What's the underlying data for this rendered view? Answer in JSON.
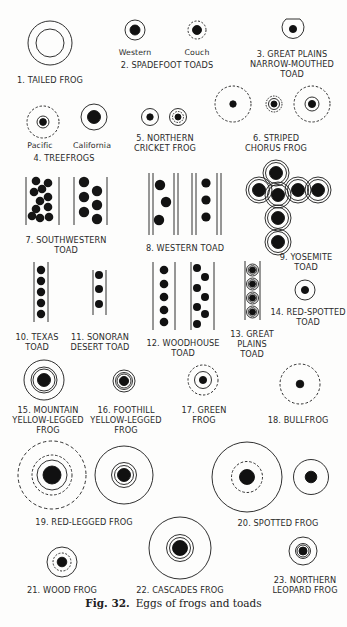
{
  "figure": {
    "caption_number": "Fig. 32.",
    "caption_text": "Eggs of frogs and toads",
    "colors": {
      "ink": "#111111",
      "paper": "#fdfdfc",
      "text": "#2a2a2a"
    }
  },
  "species": [
    {
      "id": 1,
      "label": "1. TAILED FROG",
      "egg": "two concentric solid rings, no visible yolk"
    },
    {
      "id": 2,
      "label": "2. SPADEFOOT TOADS",
      "sublabels": [
        "Western",
        "Couch"
      ],
      "egg": "western: solid ring with dark yolk; couch: dashed ring with dark yolk"
    },
    {
      "id": 3,
      "label_lines": [
        "3. GREAT PLAINS",
        "NARROW-MOUTHED",
        "TOAD"
      ],
      "egg": "solid ring with flat top and small yolk"
    },
    {
      "id": 4,
      "label": "4. TREEFROGS",
      "sublabels": [
        "Pacific",
        "California"
      ],
      "egg": "pacific: dashed outer, solid inner ring; california: solid ring, large yolk"
    },
    {
      "id": 5,
      "label_lines": [
        "5. NORTHERN",
        "CRICKET FROG"
      ],
      "egg": "solid ring and dashed double ring"
    },
    {
      "id": 6,
      "label_lines": [
        "6. STRIPED",
        "CHORUS FROG"
      ],
      "egg": "three eggs with dashed outer rings"
    },
    {
      "id": 7,
      "label_lines": [
        "7. SOUTHWESTERN",
        "TOAD"
      ],
      "egg": "clustered eggs in parallel strings"
    },
    {
      "id": 8,
      "label": "8. WESTERN TOAD",
      "egg": "eggs in double-walled strings"
    },
    {
      "id": 9,
      "label_lines": [
        "9. YOSEMITE",
        "TOAD"
      ],
      "egg": "cross-shaped cluster of double-ringed eggs"
    },
    {
      "id": 10,
      "label_lines": [
        "10. TEXAS",
        "TOAD"
      ],
      "egg": "single-file string of 5 eggs"
    },
    {
      "id": 11,
      "label_lines": [
        "11. SONORAN",
        "DESERT TOAD"
      ],
      "egg": "single-file string of 3 eggs"
    },
    {
      "id": 12,
      "label_lines": [
        "12. WOODHOUSE",
        "TOAD"
      ],
      "egg": "single and zig-zag strings"
    },
    {
      "id": 13,
      "label_lines": [
        "13. GREAT",
        "PLAINS",
        "TOAD"
      ],
      "egg": "beaded string of 4 eggs"
    },
    {
      "id": 14,
      "label_lines": [
        "14. RED-SPOTTED",
        "TOAD"
      ],
      "egg": "solid ring with small yolk"
    },
    {
      "id": 15,
      "label_lines": [
        "15. MOUNTAIN",
        "YELLOW-LEGGED",
        "FROG"
      ],
      "egg": "three solid rings"
    },
    {
      "id": 16,
      "label_lines": [
        "16. FOOTHILL",
        "YELLOW-LEGGED",
        "FROG"
      ],
      "egg": "multiple tight rings"
    },
    {
      "id": 17,
      "label_lines": [
        "17. GREEN",
        "FROG"
      ],
      "egg": "dashed outer, solid inner ring"
    },
    {
      "id": 18,
      "label": "18. BULLFROG",
      "egg": "dashed ring with small yolk"
    },
    {
      "id": 19,
      "label": "19. RED-LEGGED FROG",
      "egg": "dashed outer ring, inner rings; solid triple ring"
    },
    {
      "id": 20,
      "label": "20. SPOTTED FROG",
      "egg": "large solid ring with dashed inner; solid ring"
    },
    {
      "id": 21,
      "label": "21. WOOD FROG",
      "egg": "solid outer, dashed inner ring"
    },
    {
      "id": 22,
      "label": "22. CASCADES FROG",
      "egg": "large solid ring with double inner ring"
    },
    {
      "id": 23,
      "label_lines": [
        "23. NORTHERN",
        "LEOPARD FROG"
      ],
      "egg": "solid ring with double inner ring"
    }
  ],
  "labels": {
    "s1": "1. TAILED FROG",
    "s2_western": "Western",
    "s2_couch": "Couch",
    "s2": "2. SPADEFOOT TOADS",
    "s3_a": "3. GREAT PLAINS",
    "s3_b": "NARROW-MOUTHED",
    "s3_c": "TOAD",
    "s4_pacific": "Pacific",
    "s4_california": "California",
    "s4": "4. TREEFROGS",
    "s5_a": "5. NORTHERN",
    "s5_b": "CRICKET FROG",
    "s6_a": "6. STRIPED",
    "s6_b": "CHORUS FROG",
    "s7_a": "7. SOUTHWESTERN",
    "s7_b": "TOAD",
    "s8": "8. WESTERN TOAD",
    "s9_a": "9. YOSEMITE",
    "s9_b": "TOAD",
    "s10_a": "10. TEXAS",
    "s10_b": "TOAD",
    "s11_a": "11. SONORAN",
    "s11_b": "DESERT TOAD",
    "s12_a": "12. WOODHOUSE",
    "s12_b": "TOAD",
    "s13_a": "13. GREAT",
    "s13_b": "PLAINS",
    "s13_c": "TOAD",
    "s14_a": "14. RED-SPOTTED",
    "s14_b": "TOAD",
    "s15_a": "15. MOUNTAIN",
    "s15_b": "YELLOW-LEGGED",
    "s15_c": "FROG",
    "s16_a": "16. FOOTHILL",
    "s16_b": "YELLOW-LEGGED",
    "s16_c": "FROG",
    "s17_a": "17. GREEN",
    "s17_b": "FROG",
    "s18": "18. BULLFROG",
    "s19": "19. RED-LEGGED FROG",
    "s20": "20. SPOTTED FROG",
    "s21": "21. WOOD FROG",
    "s22": "22. CASCADES FROG",
    "s23_a": "23. NORTHERN",
    "s23_b": "LEOPARD FROG"
  }
}
